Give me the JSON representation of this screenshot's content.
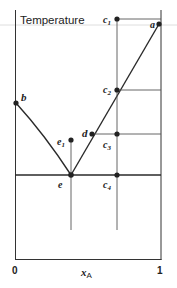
{
  "diagram": {
    "title": "Temperature",
    "x_axis": {
      "label": "x",
      "label_sub": "A",
      "tick_min": "0",
      "tick_max": "1"
    },
    "points": {
      "a": "a",
      "b": "b",
      "c1": "c",
      "c1_sub": "1",
      "c2": "c",
      "c2_sub": "2",
      "c3": "c",
      "c3_sub": "3",
      "c4": "c",
      "c4_sub": "4",
      "d": "d",
      "e": "e",
      "e1": "e",
      "e1_sub": "1"
    },
    "colors": {
      "line": "#2a2a2a",
      "thin": "#555555",
      "faint": "#cfcfcf"
    }
  }
}
